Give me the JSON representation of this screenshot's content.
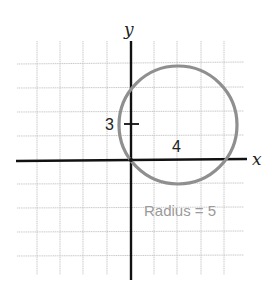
{
  "diagram": {
    "axes": {
      "x_label": "x",
      "y_label": "y"
    },
    "labels": {
      "y_tick_value": "3",
      "x_offset_value": "4",
      "radius_text": "Radius = 5"
    },
    "circle": {
      "center": [
        4,
        3
      ],
      "radius": 5
    },
    "colors": {
      "grid": "#c8c8c8",
      "axis": "#111111",
      "circle": "#8f8f8f",
      "radius_text": "#9a9a9a"
    }
  }
}
